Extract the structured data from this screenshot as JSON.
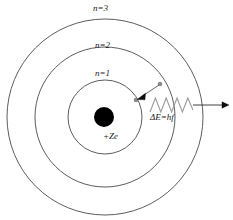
{
  "diagram": {
    "background_color": "#ffffff",
    "line_color": "#3a3a3a",
    "nucleus_color": "#000000",
    "labels": {
      "shell_n3": "n=3",
      "shell_n2": "n=2",
      "shell_n1": "n=1",
      "nucleus_charge": "+Ze",
      "photon_energy": "ΔE=hf"
    },
    "shells": [
      {
        "name": "n=1",
        "center_x": 105,
        "center_y": 117,
        "radius": 37
      },
      {
        "name": "n=2",
        "center_x": 105,
        "center_y": 117,
        "radius": 70
      },
      {
        "name": "n=3",
        "center_x": 105,
        "center_y": 117,
        "radius": 98
      }
    ],
    "nucleus": {
      "center_x": 104,
      "center_y": 117,
      "radius": 10
    },
    "electron_start": {
      "x": 159,
      "y": 84
    },
    "electron_end": {
      "x": 137,
      "y": 99
    },
    "transition_direction": "n=2 to n=1",
    "photon_wave": {
      "start_x": 150,
      "end_x": 193,
      "center_y": 105,
      "amplitude": 7,
      "cycles": 4
    },
    "photon_arrow": {
      "start_x": 193,
      "end_x": 228,
      "y": 105
    }
  }
}
